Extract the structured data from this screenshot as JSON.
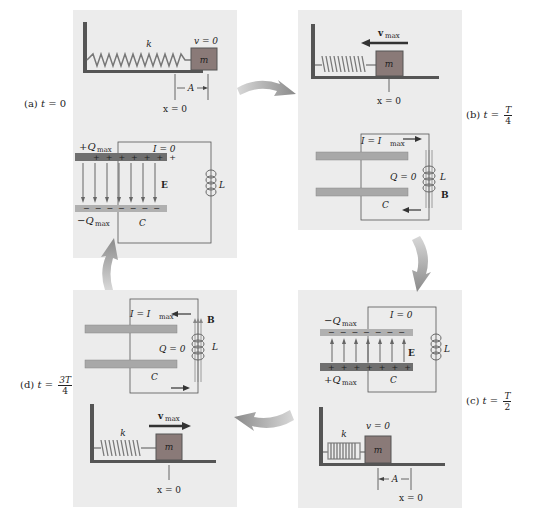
{
  "panels": {
    "a": {
      "label": "(a)",
      "time_var": "t",
      "time_eq": "=",
      "time_value": "0",
      "spring_label": "k",
      "velocity_label": "v = 0",
      "mass_label": "m",
      "amplitude_label": "A",
      "position_label": "x = 0",
      "top_charge": "+Q",
      "top_charge_sub": "max",
      "bottom_charge": "−Q",
      "bottom_charge_sub": "max",
      "current_label": "I = 0",
      "field_label": "E",
      "inductor_label": "L",
      "capacitor_label": "C"
    },
    "b": {
      "label": "(b)",
      "time_var": "t",
      "time_eq": "=",
      "time_num": "T",
      "time_den": "4",
      "velocity_label": "v",
      "velocity_sub": "max",
      "mass_label": "m",
      "position_label": "x = 0",
      "current_label": "I = I",
      "current_sub": "max",
      "charge_label": "Q = 0",
      "inductor_label": "L",
      "field_label": "B",
      "capacitor_label": "C"
    },
    "c": {
      "label": "(c)",
      "time_var": "t",
      "time_eq": "=",
      "time_num": "T",
      "time_den": "2",
      "top_charge": "−Q",
      "top_charge_sub": "max",
      "bottom_charge": "+Q",
      "bottom_charge_sub": "max",
      "current_label": "I = 0",
      "field_label": "E",
      "inductor_label": "L",
      "capacitor_label": "C",
      "spring_label": "k",
      "velocity_label": "v = 0",
      "mass_label": "m",
      "amplitude_label": "A",
      "position_label": "x = 0"
    },
    "d": {
      "label": "(d)",
      "time_var": "t",
      "time_eq": "=",
      "time_num": "3T",
      "time_den": "4",
      "current_label": "I = I",
      "current_sub": "max",
      "charge_label": "Q = 0",
      "field_label": "B",
      "inductor_label": "L",
      "capacitor_label": "C",
      "spring_label": "k",
      "velocity_label": "v",
      "velocity_sub": "max",
      "mass_label": "m",
      "position_label": "x = 0"
    }
  },
  "colors": {
    "panel_bg": "#ececec",
    "mass": "#8a7a78",
    "positive_plate": "#6f6f6f",
    "negative_plate": "#b0b0b0",
    "neutral_plate": "#a8a8a8",
    "arrow": "#9a9a9a",
    "wire": "#555555"
  }
}
